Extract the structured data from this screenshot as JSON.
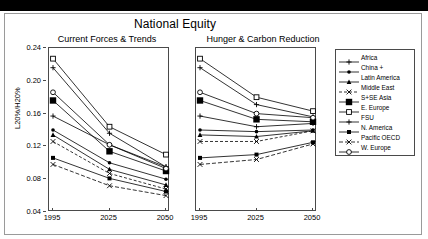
{
  "slide": {
    "main_title": "National Equity",
    "top_band_color": "#000000",
    "frame_border_color": "#9a9a9a"
  },
  "panels": [
    {
      "key": "left",
      "subtitle": "Current Forces & Trends"
    },
    {
      "key": "right",
      "subtitle": "Hunger & Carbon Reduction"
    }
  ],
  "axes": {
    "ylabel": "L20%/H20%",
    "yticks": [
      "0.04",
      "0.08",
      "0.12",
      "0.16",
      "0.20",
      "0.24"
    ],
    "ylim": [
      0.04,
      0.24
    ],
    "xticks": [
      "1995",
      "2025",
      "2050"
    ],
    "x": [
      1995,
      2025,
      2050
    ]
  },
  "legend": {
    "entries": [
      {
        "label": "Africa",
        "marker": "plus",
        "dash": "none",
        "color": "#000000"
      },
      {
        "label": "China +",
        "marker": "dot",
        "dash": "none",
        "color": "#000000"
      },
      {
        "label": "Latin America",
        "marker": "triangle",
        "dash": "none",
        "color": "#000000"
      },
      {
        "label": "Middle East",
        "marker": "cross",
        "dash": "3,2",
        "color": "#000000"
      },
      {
        "label": "S+SE Asia",
        "marker": "bigsquare",
        "dash": "none",
        "color": "#000000"
      },
      {
        "label": "E. Europe",
        "marker": "opensquare",
        "dash": "none",
        "color": "#000000"
      },
      {
        "label": "FSU",
        "marker": "plus",
        "dash": "none",
        "color": "#000000"
      },
      {
        "label": "N. America",
        "marker": "square",
        "dash": "none",
        "color": "#000000"
      },
      {
        "label": "Pacific OECD",
        "marker": "cross",
        "dash": "4,2",
        "color": "#000000"
      },
      {
        "label": "W. Europe",
        "marker": "opencircle",
        "dash": "none",
        "color": "#000000"
      }
    ]
  },
  "chart_data": {
    "type": "line",
    "title": "National Equity",
    "xlabel": "",
    "ylabel": "L20%/H20%",
    "x": [
      1995,
      2025,
      2050
    ],
    "xlim": [
      1995,
      2050
    ],
    "ylim": [
      0.04,
      0.24
    ],
    "grid": false,
    "legend_position": "right",
    "subplots": [
      {
        "title": "Current Forces & Trends",
        "series": [
          {
            "name": "Africa",
            "values": [
              0.216,
              0.136,
              0.095
            ]
          },
          {
            "name": "China +",
            "values": [
              0.14,
              0.1,
              0.08
            ]
          },
          {
            "name": "Latin America",
            "values": [
              0.134,
              0.092,
              0.073
            ]
          },
          {
            "name": "Middle East",
            "values": [
              0.126,
              0.087,
              0.068
            ]
          },
          {
            "name": "S+SE Asia",
            "values": [
              0.176,
              0.114,
              0.09
            ]
          },
          {
            "name": "E. Europe",
            "values": [
              0.227,
              0.144,
              0.11
            ]
          },
          {
            "name": "FSU",
            "values": [
              0.157,
              0.122,
              0.095
            ]
          },
          {
            "name": "N. America",
            "values": [
              0.106,
              0.081,
              0.065
            ]
          },
          {
            "name": "Pacific OECD",
            "values": [
              0.098,
              0.072,
              0.06
            ]
          },
          {
            "name": "W. Europe",
            "values": [
              0.186,
              0.122,
              0.093
            ]
          }
        ]
      },
      {
        "title": "Hunger & Carbon Reduction",
        "series": [
          {
            "name": "Africa",
            "values": [
              0.216,
              0.171,
              0.156
            ]
          },
          {
            "name": "China +",
            "values": [
              0.14,
              0.138,
              0.14
            ]
          },
          {
            "name": "Latin America",
            "values": [
              0.134,
              0.132,
              0.139
            ]
          },
          {
            "name": "Middle East",
            "values": [
              0.126,
              0.126,
              0.139
            ]
          },
          {
            "name": "S+SE Asia",
            "values": [
              0.176,
              0.153,
              0.15
            ]
          },
          {
            "name": "E. Europe",
            "values": [
              0.227,
              0.18,
              0.163
            ]
          },
          {
            "name": "FSU",
            "values": [
              0.157,
              0.144,
              0.148
            ]
          },
          {
            "name": "N. America",
            "values": [
              0.106,
              0.11,
              0.125
            ]
          },
          {
            "name": "Pacific OECD",
            "values": [
              0.098,
              0.104,
              0.123
            ]
          },
          {
            "name": "W. Europe",
            "values": [
              0.186,
              0.16,
              0.155
            ]
          }
        ]
      }
    ]
  }
}
